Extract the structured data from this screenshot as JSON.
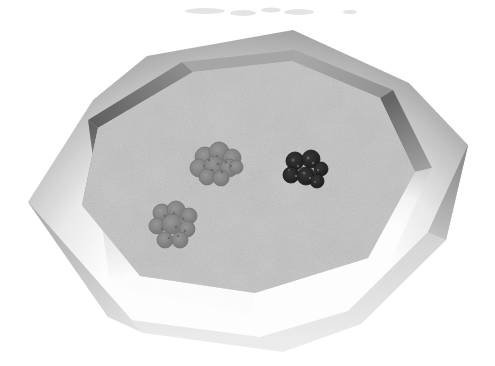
{
  "figure": {
    "type": "grayscale-3d-render",
    "background_color": "#ffffff"
  },
  "palette": {
    "background": "#ffffff",
    "floor": "#aeaeae",
    "rim_highlight": "#ffffff",
    "rim_shadow": "#9a9a9a",
    "wall_dark": "#5e5e5e",
    "wall_mid": "#a4a4a4",
    "outer_face_light": "#ededed",
    "outer_face_dark": "#8e8e8e",
    "cluster_gray": "#949494",
    "cluster_gray_edge": "#6f6f6f",
    "cluster_dark": "#2f2f2f",
    "cluster_dark_edge": "#101010",
    "smudge": "#dcdcdc"
  },
  "clusters": [
    {
      "name": "gray-cluster-center",
      "shade": "gray",
      "cx": 218,
      "cy": 165,
      "blobs": [
        [
          205,
          157,
          10
        ],
        [
          219,
          152,
          10
        ],
        [
          232,
          158,
          9
        ],
        [
          199,
          168,
          9
        ],
        [
          214,
          166,
          10
        ],
        [
          229,
          168,
          9
        ],
        [
          207,
          177,
          8
        ],
        [
          221,
          178,
          8
        ],
        [
          236,
          167,
          7
        ]
      ],
      "speckle_color": "#686868",
      "speckles": [
        [
          209,
          160,
          1.4
        ],
        [
          217,
          156,
          1.2
        ],
        [
          226,
          162,
          1.5
        ],
        [
          212,
          170,
          1.3
        ],
        [
          222,
          172,
          1.4
        ],
        [
          231,
          166,
          1.2
        ],
        [
          204,
          166,
          1.2
        ],
        [
          218,
          164,
          1.6
        ]
      ]
    },
    {
      "name": "gray-cluster-lower-left",
      "shade": "gray",
      "cx": 175,
      "cy": 226,
      "blobs": [
        [
          162,
          213,
          9
        ],
        [
          176,
          210,
          9
        ],
        [
          189,
          216,
          8
        ],
        [
          157,
          226,
          8
        ],
        [
          172,
          224,
          10
        ],
        [
          187,
          229,
          8
        ],
        [
          165,
          240,
          8
        ],
        [
          180,
          240,
          8
        ]
      ],
      "speckle_color": "#686868",
      "speckles": [
        [
          165,
          216,
          1.4
        ],
        [
          174,
          213,
          1.2
        ],
        [
          183,
          219,
          1.4
        ],
        [
          162,
          229,
          1.3
        ],
        [
          176,
          227,
          1.5
        ],
        [
          185,
          231,
          1.2
        ],
        [
          169,
          238,
          1.3
        ],
        [
          178,
          236,
          1.2
        ]
      ]
    },
    {
      "name": "dark-cluster-right",
      "shade": "dark",
      "cx": 305,
      "cy": 171,
      "blobs": [
        [
          295,
          161,
          9
        ],
        [
          311,
          159,
          9
        ],
        [
          321,
          169,
          7
        ],
        [
          291,
          175,
          8
        ],
        [
          306,
          176,
          9
        ],
        [
          317,
          181,
          7
        ]
      ],
      "speckle_color": "#5a5a5a",
      "speckles": [
        [
          293,
          160,
          1.5
        ],
        [
          298,
          166,
          1.2
        ],
        [
          308,
          158,
          1.5
        ],
        [
          313,
          163,
          1.3
        ],
        [
          304,
          173,
          1.5
        ],
        [
          310,
          178,
          1.2
        ],
        [
          318,
          170,
          1.2
        ],
        [
          296,
          176,
          1.3
        ],
        [
          289,
          170,
          1.1
        ],
        [
          315,
          182,
          1.1
        ]
      ]
    }
  ],
  "smudges": [
    [
      205,
      11,
      20,
      3
    ],
    [
      243,
      13,
      13,
      3
    ],
    [
      271,
      10,
      10,
      2.5
    ],
    [
      299,
      12,
      15,
      3
    ],
    [
      350,
      12,
      7,
      2
    ]
  ]
}
